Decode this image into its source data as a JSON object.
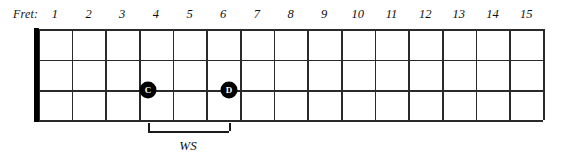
{
  "diagram": {
    "fret_label": "Fret:",
    "fret_numbers": [
      "1",
      "2",
      "3",
      "4",
      "5",
      "6",
      "7",
      "8",
      "9",
      "10",
      "11",
      "12",
      "13",
      "14",
      "15"
    ],
    "string_count": 4,
    "fret_count": 15,
    "colors": {
      "line": "#2a2a2a",
      "nut": "#000000",
      "marker_fill": "#000000",
      "marker_text": "#ffffff",
      "text": "#111111",
      "background": "#ffffff"
    },
    "geometry": {
      "nut_x": 34,
      "board_left": 38,
      "board_right": 543,
      "board_top": 29,
      "board_bottom": 120,
      "fret_width": 33.7,
      "string_ys": [
        29,
        59.5,
        90,
        120
      ]
    },
    "notes": [
      {
        "label": "C",
        "fret": 3,
        "string_index": 2,
        "x": 148,
        "y": 90
      },
      {
        "label": "D",
        "fret": 5,
        "string_index": 2,
        "x": 229,
        "y": 90
      }
    ],
    "bracket": {
      "label": "WS",
      "meaning": "whole step",
      "start_x": 148,
      "end_x": 229,
      "y": 131,
      "tick_height": 8,
      "label_x": 188,
      "label_y": 138
    }
  }
}
